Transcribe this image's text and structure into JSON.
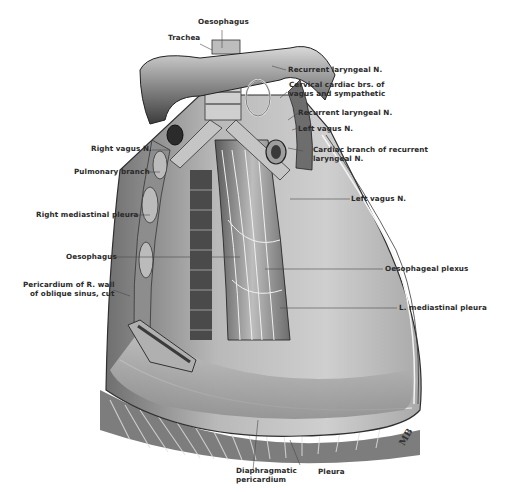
{
  "figure": {
    "signature": "MB"
  },
  "labels": {
    "oesophagus_top": "Oesophagus",
    "trachea": "Trachea",
    "recurrent_laryngeal_1": "Recurrent laryngeal N.",
    "cervical_cardiac": [
      "Cervical cardiac brs. of",
      "vagus and sympathetic"
    ],
    "recurrent_laryngeal_2": "Recurrent laryngeal N.",
    "left_vagus_upper": "Left vagus N.",
    "cardiac_branch": [
      "Cardiac branch of recurrent",
      "laryngeal N."
    ],
    "right_vagus": "Right vagus N.",
    "pulmonary_branch": "Pulmonary branch",
    "right_mediastinal_pleura": "Right mediastinal pleura",
    "left_vagus_lower": "Left vagus N.",
    "oesophagus_mid": "Oesophagus",
    "oesophageal_plexus": "Oesophageal plexus",
    "pericardium_r_wall": [
      "Pericardium of R. wall",
      "of oblique sinus, cut"
    ],
    "l_mediastinal_pleura": "L. mediastinal pleura",
    "diaphragmatic_pericardium": [
      "Diaphragmatic",
      "pericardium"
    ],
    "pleura": "Pleura"
  }
}
